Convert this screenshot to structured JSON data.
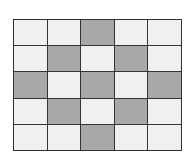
{
  "grid": {
    "rows": 5,
    "cols": 5,
    "colors": {
      "shaded": "#a8a8a8",
      "unshaded": "#f0f0f0",
      "line": "#333333"
    },
    "cells": [
      [
        0,
        0,
        1,
        0,
        0
      ],
      [
        0,
        1,
        0,
        1,
        0
      ],
      [
        1,
        0,
        1,
        0,
        1
      ],
      [
        0,
        1,
        0,
        1,
        0
      ],
      [
        0,
        0,
        1,
        0,
        0
      ]
    ]
  }
}
